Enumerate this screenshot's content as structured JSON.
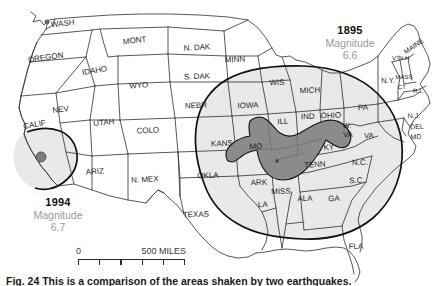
{
  "figure": {
    "caption": "Fig. 24 This is a comparison of the areas shaken by two earthquakes.",
    "background_color": "#ffffff"
  },
  "colors": {
    "state_fill": "#ffffff",
    "state_outline": "#3a3a3a",
    "felt_area_fill": "#e9e9e9",
    "felt_area_outline": "#111111",
    "damage_zone_fill": "#8b8b8b",
    "damage_zone_outline": "#111111",
    "epicenter_dot": "#7d7d7d",
    "year_text": "#111111",
    "magnitude_text": "#9a9a9a"
  },
  "annotations": [
    {
      "id": "annot-1895",
      "year": "1895",
      "magnitude_label": "Magnitude",
      "magnitude_value": "6.6"
    },
    {
      "id": "annot-1994",
      "year": "1994",
      "magnitude_label": "Magnitude",
      "magnitude_value": "6.7"
    }
  ],
  "scale_bar": {
    "zero_label": "0",
    "max_label": "500 MILES",
    "tick_count": 6
  },
  "state_labels": [
    {
      "name": "WASH",
      "x": 63,
      "y": 26,
      "size": 8.0,
      "rot": -6
    },
    {
      "name": "OREGON",
      "x": 46,
      "y": 60,
      "size": 8.0,
      "rot": -8
    },
    {
      "name": "IDAHO",
      "x": 95,
      "y": 73,
      "size": 8.0,
      "rot": -9
    },
    {
      "name": "MONT",
      "x": 135,
      "y": 43,
      "size": 8.0,
      "rot": -7
    },
    {
      "name": "WYO",
      "x": 139,
      "y": 88,
      "size": 8.0,
      "rot": -5
    },
    {
      "name": "N. DAK",
      "x": 197,
      "y": 50,
      "size": 8.0,
      "rot": -3
    },
    {
      "name": "S. DAK",
      "x": 197,
      "y": 79,
      "size": 8.0,
      "rot": -2
    },
    {
      "name": "NEBR",
      "x": 196,
      "y": 108,
      "size": 8.0,
      "rot": -2
    },
    {
      "name": "MINN",
      "x": 235,
      "y": 62,
      "size": 8.0,
      "rot": -3
    },
    {
      "name": "NEV",
      "x": 61,
      "y": 112,
      "size": 8.0,
      "rot": -7
    },
    {
      "name": "UTAH",
      "x": 104,
      "y": 125,
      "size": 8.0,
      "rot": -5
    },
    {
      "name": "COLO",
      "x": 148,
      "y": 133,
      "size": 8.0,
      "rot": -3
    },
    {
      "name": "CALIF",
      "x": 35,
      "y": 127,
      "size": 8.0,
      "rot": -10
    },
    {
      "name": "ARIZ",
      "x": 95,
      "y": 174,
      "size": 8.0,
      "rot": -5
    },
    {
      "name": "N. MEX",
      "x": 145,
      "y": 182,
      "size": 8.0,
      "rot": -3
    },
    {
      "name": "TEXAS",
      "x": 196,
      "y": 217,
      "size": 8.0,
      "rot": -2
    },
    {
      "name": "OKLA",
      "x": 208,
      "y": 178,
      "size": 8.0,
      "rot": -2
    },
    {
      "name": "KANS",
      "x": 222,
      "y": 146,
      "size": 8.0,
      "rot": -2
    },
    {
      "name": "IOWA",
      "x": 248,
      "y": 108,
      "size": 8.0,
      "rot": -2
    },
    {
      "name": "WIS",
      "x": 277,
      "y": 85,
      "size": 8.0,
      "rot": -2
    },
    {
      "name": "MICH",
      "x": 310,
      "y": 93,
      "size": 8.0,
      "rot": -2
    },
    {
      "name": "ILL",
      "x": 283,
      "y": 124,
      "size": 8.0,
      "rot": -2
    },
    {
      "name": "IND",
      "x": 308,
      "y": 119,
      "size": 8.0,
      "rot": -2
    },
    {
      "name": "OHIO",
      "x": 331,
      "y": 118,
      "size": 8.0,
      "rot": -2
    },
    {
      "name": "PA",
      "x": 363,
      "y": 110,
      "size": 8.0,
      "rot": -2
    },
    {
      "name": "MO",
      "x": 256,
      "y": 149,
      "size": 8.0,
      "rot": -2
    },
    {
      "name": "ARK",
      "x": 259,
      "y": 185,
      "size": 8.0,
      "rot": -2
    },
    {
      "name": "MISS",
      "x": 281,
      "y": 194,
      "size": 8.0,
      "rot": -2
    },
    {
      "name": "LA",
      "x": 263,
      "y": 207,
      "size": 8.0,
      "rot": -2
    },
    {
      "name": "TENN",
      "x": 315,
      "y": 167,
      "size": 8.0,
      "rot": -4
    },
    {
      "name": "KY",
      "x": 329,
      "y": 150,
      "size": 8.0,
      "rot": -3
    },
    {
      "name": "ALA",
      "x": 305,
      "y": 201,
      "size": 8.0,
      "rot": -2
    },
    {
      "name": "GA",
      "x": 334,
      "y": 201,
      "size": 8.0,
      "rot": -2
    },
    {
      "name": "FLA",
      "x": 356,
      "y": 249,
      "size": 8.0,
      "rot": -2
    },
    {
      "name": "S.C.",
      "x": 357,
      "y": 183,
      "size": 8.0,
      "rot": -2
    },
    {
      "name": "N.C.",
      "x": 360,
      "y": 165,
      "size": 8.0,
      "rot": -2
    },
    {
      "name": "W.",
      "x": 347,
      "y": 128,
      "size": 7.5,
      "rot": -2
    },
    {
      "name": "VA",
      "x": 348,
      "y": 137,
      "size": 7.5,
      "rot": -2
    },
    {
      "name": "VA",
      "x": 369,
      "y": 138,
      "size": 7.5,
      "rot": -2
    },
    {
      "name": "N.Y.",
      "x": 388,
      "y": 83,
      "size": 7.5,
      "rot": -2
    },
    {
      "name": "N.J.",
      "x": 414,
      "y": 118,
      "size": 7.0,
      "rot": -2
    },
    {
      "name": "DEL",
      "x": 417,
      "y": 129,
      "size": 7.0,
      "rot": -2
    },
    {
      "name": "MD",
      "x": 416,
      "y": 139,
      "size": 7.0,
      "rot": -2
    },
    {
      "name": "MAINE",
      "x": 415,
      "y": 48,
      "size": 7.0,
      "rot": -34
    },
    {
      "name": "VT",
      "x": 396,
      "y": 60,
      "size": 6.0,
      "rot": -2
    },
    {
      "name": "N.H.",
      "x": 405,
      "y": 60,
      "size": 6.0,
      "rot": -2
    },
    {
      "name": "MASS",
      "x": 404,
      "y": 79,
      "size": 6.0,
      "rot": -2
    },
    {
      "name": "CT",
      "x": 402,
      "y": 89,
      "size": 6.0,
      "rot": -2
    },
    {
      "name": "R.I.",
      "x": 418,
      "y": 93,
      "size": 6.5,
      "rot": -2
    }
  ],
  "epicenters": [
    {
      "id": "epicenter-1994",
      "x": 41,
      "y": 157,
      "r": 5.0
    },
    {
      "id": "epicenter-1895",
      "x": 277,
      "y": 161,
      "r": 1.6
    },
    {
      "id": "marker-washington",
      "x": 47,
      "y": 22,
      "r": 2.0
    }
  ],
  "zones": [
    {
      "id": "felt-area-1895",
      "label": "1895 felt area"
    },
    {
      "id": "damage-zone-1895",
      "label": "1895 strong-shaking zone"
    },
    {
      "id": "felt-area-1994",
      "label": "1994 felt area"
    }
  ]
}
